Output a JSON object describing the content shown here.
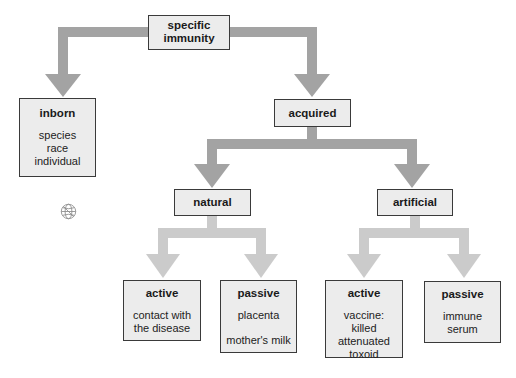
{
  "diagram": {
    "type": "hierarchy-flowchart",
    "colors": {
      "box_fill": "#ececec",
      "box_border": "#3a3a3a",
      "arrow_primary": "#a3a3a3",
      "arrow_secondary": "#cbcbcb"
    },
    "nodes": {
      "root": {
        "title": "specific immunity",
        "title_lines": [
          "specific",
          "immunity"
        ]
      },
      "inborn": {
        "title": "inborn",
        "items": [
          "species",
          "race",
          "individual"
        ]
      },
      "acquired": {
        "title": "acquired"
      },
      "natural": {
        "title": "natural"
      },
      "artificial": {
        "title": "artificial"
      },
      "natural_active": {
        "title": "active",
        "items": [
          "contact with",
          "the disease"
        ]
      },
      "natural_passive": {
        "title": "passive",
        "items": [
          "placenta",
          "mother's milk"
        ]
      },
      "artificial_active": {
        "title": "active",
        "items": [
          "vaccine:",
          "killed",
          "attenuated",
          "toxoid"
        ]
      },
      "artificial_passive": {
        "title": "passive",
        "items": [
          "immune",
          "serum"
        ]
      }
    },
    "edges": [
      [
        "specific immunity",
        "inborn"
      ],
      [
        "specific immunity",
        "acquired"
      ],
      [
        "acquired",
        "natural"
      ],
      [
        "acquired",
        "artificial"
      ],
      [
        "natural",
        "active (natural)"
      ],
      [
        "natural",
        "passive (natural)"
      ],
      [
        "artificial",
        "active (artificial)"
      ],
      [
        "artificial",
        "passive (artificial)"
      ]
    ],
    "icons": {
      "decoration": "globe-icon"
    }
  }
}
